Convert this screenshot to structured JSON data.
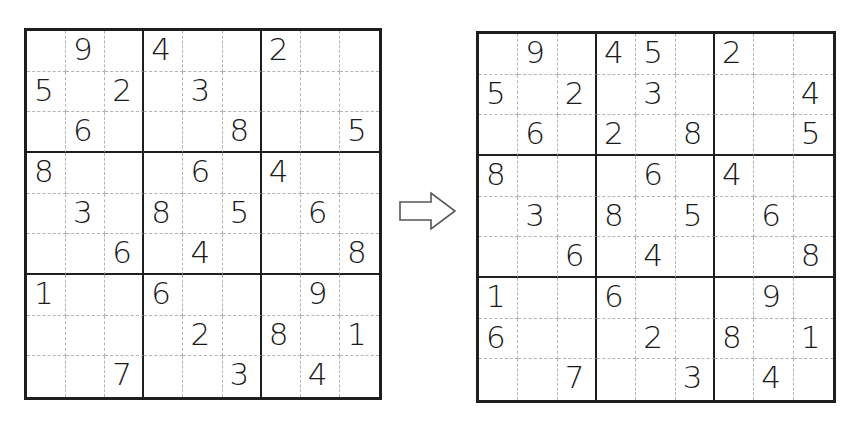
{
  "puzzle_before": {
    "label": "initial-grid",
    "rows": [
      [
        "",
        "9",
        "",
        "4",
        "",
        "",
        "2",
        "",
        ""
      ],
      [
        "5",
        "",
        "2",
        "",
        "3",
        "",
        "",
        "",
        ""
      ],
      [
        "",
        "6",
        "",
        "",
        "",
        "8",
        "",
        "",
        "5"
      ],
      [
        "8",
        "",
        "",
        "",
        "6",
        "",
        "4",
        "",
        ""
      ],
      [
        "",
        "3",
        "",
        "8",
        "",
        "5",
        "",
        "6",
        ""
      ],
      [
        "",
        "",
        "6",
        "",
        "4",
        "",
        "",
        "",
        "8"
      ],
      [
        "1",
        "",
        "",
        "6",
        "",
        "",
        "",
        "9",
        ""
      ],
      [
        "",
        "",
        "",
        "",
        "2",
        "",
        "8",
        "",
        "1"
      ],
      [
        "",
        "",
        "7",
        "",
        "",
        "3",
        "",
        "4",
        ""
      ]
    ]
  },
  "puzzle_after": {
    "label": "updated-grid",
    "rows": [
      [
        "",
        "9",
        "",
        "4",
        "5",
        "",
        "2",
        "",
        ""
      ],
      [
        "5",
        "",
        "2",
        "",
        "3",
        "",
        "",
        "",
        "4"
      ],
      [
        "",
        "6",
        "",
        "2",
        "",
        "8",
        "",
        "",
        "5"
      ],
      [
        "8",
        "",
        "",
        "",
        "6",
        "",
        "4",
        "",
        ""
      ],
      [
        "",
        "3",
        "",
        "8",
        "",
        "5",
        "",
        "6",
        ""
      ],
      [
        "",
        "",
        "6",
        "",
        "4",
        "",
        "",
        "",
        "8"
      ],
      [
        "1",
        "",
        "",
        "6",
        "",
        "",
        "",
        "9",
        ""
      ],
      [
        "6",
        "",
        "",
        "",
        "2",
        "",
        "8",
        "",
        "1"
      ],
      [
        "",
        "",
        "7",
        "",
        "",
        "3",
        "",
        "4",
        ""
      ]
    ]
  },
  "arrow": {
    "icon": "right-arrow-icon",
    "stroke": "#555555"
  },
  "colors": {
    "grid_line": "#1e1e1e",
    "minor_line": "#b4b4b4",
    "digit": "#1a1a1a",
    "background": "#ffffff"
  }
}
